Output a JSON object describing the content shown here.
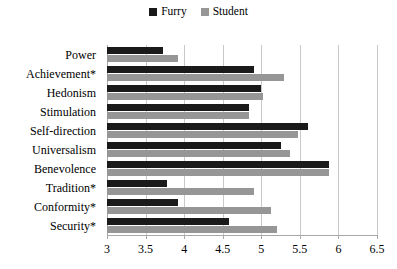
{
  "chart_data": {
    "type": "bar",
    "orientation": "horizontal",
    "title": "",
    "xlabel": "",
    "ylabel": "",
    "xlim": [
      3,
      6.5
    ],
    "xticks": [
      "3",
      "3.5",
      "4",
      "4.5",
      "5",
      "5.5",
      "6",
      "6.5"
    ],
    "xtick_values": [
      3,
      3.5,
      4,
      4.5,
      5,
      5.5,
      6,
      6.5
    ],
    "grid": true,
    "legend_position": "top-center",
    "categories": [
      "Power",
      "Achievement*",
      "Hedonism",
      "Stimulation",
      "Self-direction",
      "Universalism",
      "Benevolence",
      "Tradition*",
      "Conformity*",
      "Security*"
    ],
    "series": [
      {
        "name": "Furry",
        "color": "#1a1a1a",
        "values": [
          3.72,
          4.9,
          5.0,
          4.84,
          5.6,
          5.26,
          5.88,
          3.78,
          3.92,
          4.58
        ]
      },
      {
        "name": "Student",
        "color": "#969696",
        "values": [
          3.92,
          5.29,
          5.02,
          4.84,
          5.47,
          5.37,
          5.88,
          4.9,
          5.12,
          5.2
        ]
      }
    ]
  }
}
